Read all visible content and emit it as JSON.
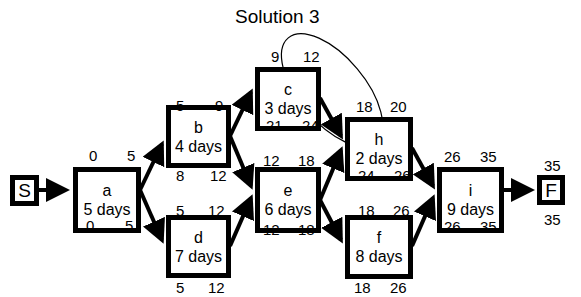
{
  "title": "Solution 3",
  "nodes": {
    "S": {
      "label": "S"
    },
    "a": {
      "label": "a",
      "duration": "5 days",
      "es": "0",
      "ef": "5",
      "ls": "0",
      "lf": "5"
    },
    "b": {
      "label": "b",
      "duration": "4 days",
      "es": "5",
      "ef": "9",
      "ls": "8",
      "lf": "12"
    },
    "c": {
      "label": "c",
      "duration": "3 days",
      "es": "9",
      "ef": "12",
      "ls": "21",
      "lf": "24"
    },
    "d": {
      "label": "d",
      "duration": "7 days",
      "es": "5",
      "ef": "12",
      "ls": "5",
      "lf": "12"
    },
    "e": {
      "label": "e",
      "duration": "6 days",
      "es": "12",
      "ef": "18",
      "ls": "12",
      "lf": "18"
    },
    "h": {
      "label": "h",
      "duration": "2 days",
      "es": "18",
      "ef": "20",
      "ls": "24",
      "lf": "26"
    },
    "f": {
      "label": "f",
      "duration": "8 days",
      "es": "18",
      "ef": "26",
      "ls": "18",
      "lf": "26"
    },
    "i": {
      "label": "i",
      "duration": "9 days",
      "es": "26",
      "ef": "35",
      "ls": "26",
      "lf": "35"
    },
    "F": {
      "label": "F",
      "es": "35",
      "lf": "35"
    }
  },
  "edges": [
    [
      "S",
      "a"
    ],
    [
      "a",
      "b"
    ],
    [
      "a",
      "d"
    ],
    [
      "b",
      "c"
    ],
    [
      "b",
      "e"
    ],
    [
      "d",
      "e"
    ],
    [
      "c",
      "h"
    ],
    [
      "e",
      "h"
    ],
    [
      "e",
      "f"
    ],
    [
      "h",
      "i"
    ],
    [
      "f",
      "i"
    ],
    [
      "i",
      "F"
    ]
  ],
  "annotation": "ellipse-circling-c-and-h"
}
